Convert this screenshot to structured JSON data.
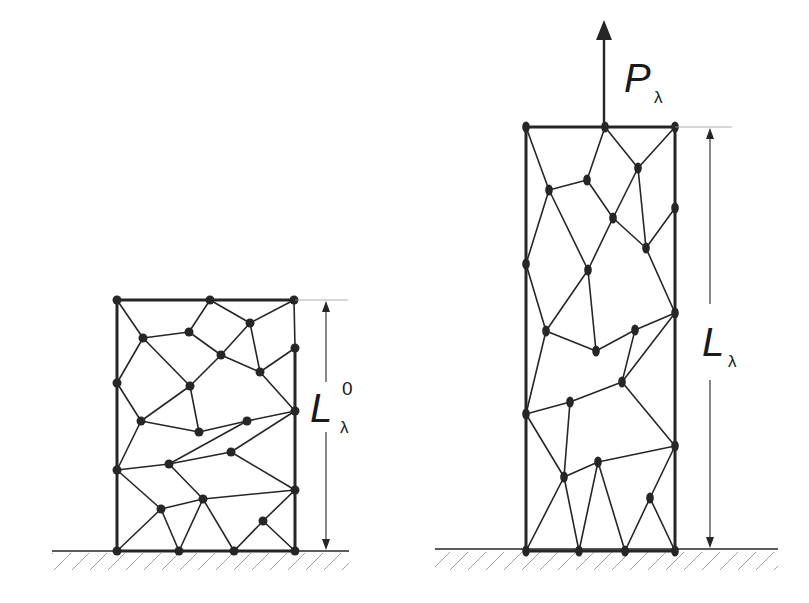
{
  "figure": {
    "colors": {
      "background": "#ffffff",
      "ink": "#262626",
      "guide": "#9a9a9a",
      "hatch": "#8c8c8c",
      "bleed_text": "#ececec"
    }
  },
  "labels": {
    "load": {
      "symbol": "P",
      "subscript": "λ"
    },
    "reference_length": {
      "symbol": "L",
      "subscript": "λ",
      "superscript": "0"
    },
    "deformed_length": {
      "symbol": "L",
      "subscript": "λ"
    }
  },
  "left_mesh": {
    "name": "reference configuration",
    "frame": {
      "x0": 117,
      "x1": 295,
      "y_top": 300,
      "y_bottom": 551
    },
    "nodes": [
      [
        117,
        300
      ],
      [
        210,
        300
      ],
      [
        294,
        300
      ],
      [
        250,
        323
      ],
      [
        189,
        332
      ],
      [
        143,
        338
      ],
      [
        221,
        355
      ],
      [
        260,
        372
      ],
      [
        295,
        348
      ],
      [
        117,
        383
      ],
      [
        190,
        386
      ],
      [
        141,
        421
      ],
      [
        199,
        432
      ],
      [
        247,
        421
      ],
      [
        295,
        411
      ],
      [
        231,
        452
      ],
      [
        169,
        464
      ],
      [
        117,
        470
      ],
      [
        295,
        490
      ],
      [
        203,
        499
      ],
      [
        161,
        509
      ],
      [
        263,
        521
      ],
      [
        117,
        551
      ],
      [
        179,
        551
      ],
      [
        234,
        551
      ],
      [
        295,
        551
      ]
    ],
    "edges": [
      [
        0,
        1
      ],
      [
        1,
        2
      ],
      [
        2,
        8
      ],
      [
        8,
        14
      ],
      [
        14,
        18
      ],
      [
        18,
        25
      ],
      [
        0,
        9
      ],
      [
        9,
        17
      ],
      [
        17,
        22
      ],
      [
        22,
        23
      ],
      [
        23,
        24
      ],
      [
        24,
        25
      ],
      [
        0,
        5
      ],
      [
        1,
        4
      ],
      [
        1,
        3
      ],
      [
        2,
        3
      ],
      [
        3,
        6
      ],
      [
        3,
        7
      ],
      [
        4,
        5
      ],
      [
        4,
        6
      ],
      [
        5,
        9
      ],
      [
        5,
        10
      ],
      [
        6,
        10
      ],
      [
        6,
        7
      ],
      [
        7,
        8
      ],
      [
        7,
        14
      ],
      [
        9,
        11
      ],
      [
        10,
        11
      ],
      [
        10,
        12
      ],
      [
        11,
        12
      ],
      [
        12,
        13
      ],
      [
        13,
        14
      ],
      [
        13,
        16
      ],
      [
        14,
        15
      ],
      [
        11,
        17
      ],
      [
        15,
        16
      ],
      [
        15,
        18
      ],
      [
        16,
        17
      ],
      [
        16,
        19
      ],
      [
        17,
        20
      ],
      [
        19,
        20
      ],
      [
        19,
        18
      ],
      [
        20,
        22
      ],
      [
        20,
        23
      ],
      [
        19,
        23
      ],
      [
        19,
        24
      ],
      [
        24,
        21
      ],
      [
        21,
        18
      ],
      [
        21,
        25
      ]
    ]
  },
  "right_mesh": {
    "name": "deformed configuration",
    "frame": {
      "x0": 526,
      "x1": 675,
      "y_top": 127,
      "y_bottom": 551
    },
    "nodes": [
      [
        526,
        127
      ],
      [
        605,
        127
      ],
      [
        675,
        127
      ],
      [
        638,
        168
      ],
      [
        587,
        180
      ],
      [
        549,
        190
      ],
      [
        613,
        218
      ],
      [
        675,
        208
      ],
      [
        646,
        248
      ],
      [
        526,
        264
      ],
      [
        588,
        270
      ],
      [
        546,
        331
      ],
      [
        635,
        330
      ],
      [
        675,
        313
      ],
      [
        596,
        351
      ],
      [
        622,
        382
      ],
      [
        570,
        402
      ],
      [
        526,
        414
      ],
      [
        675,
        446
      ],
      [
        598,
        462
      ],
      [
        564,
        477
      ],
      [
        650,
        498
      ],
      [
        526,
        551
      ],
      [
        579,
        551
      ],
      [
        625,
        551
      ],
      [
        675,
        551
      ]
    ],
    "edges": [
      [
        0,
        1
      ],
      [
        1,
        2
      ],
      [
        2,
        7
      ],
      [
        7,
        13
      ],
      [
        13,
        18
      ],
      [
        18,
        25
      ],
      [
        0,
        9
      ],
      [
        9,
        17
      ],
      [
        17,
        22
      ],
      [
        22,
        23
      ],
      [
        23,
        24
      ],
      [
        24,
        25
      ],
      [
        0,
        5
      ],
      [
        1,
        4
      ],
      [
        1,
        3
      ],
      [
        2,
        3
      ],
      [
        3,
        6
      ],
      [
        3,
        8
      ],
      [
        4,
        5
      ],
      [
        4,
        6
      ],
      [
        5,
        9
      ],
      [
        5,
        10
      ],
      [
        6,
        10
      ],
      [
        6,
        8
      ],
      [
        8,
        7
      ],
      [
        8,
        13
      ],
      [
        9,
        11
      ],
      [
        10,
        11
      ],
      [
        10,
        14
      ],
      [
        11,
        14
      ],
      [
        14,
        12
      ],
      [
        12,
        13
      ],
      [
        12,
        15
      ],
      [
        13,
        15
      ],
      [
        15,
        16
      ],
      [
        15,
        18
      ],
      [
        16,
        17
      ],
      [
        16,
        20
      ],
      [
        11,
        17
      ],
      [
        17,
        20
      ],
      [
        20,
        19
      ],
      [
        19,
        18
      ],
      [
        20,
        22
      ],
      [
        20,
        23
      ],
      [
        19,
        23
      ],
      [
        19,
        24
      ],
      [
        24,
        21
      ],
      [
        21,
        18
      ],
      [
        21,
        25
      ]
    ]
  },
  "ground": {
    "left": {
      "x0": 52,
      "x1": 349,
      "y": 551
    },
    "right": {
      "x0": 435,
      "x1": 778,
      "y": 549
    }
  },
  "dimension_arrows": {
    "reference": {
      "x": 326,
      "y_top": 300,
      "y_bottom": 551,
      "label_gap": [
        382,
        432
      ]
    },
    "deformed": {
      "x": 710,
      "y_top": 127,
      "y_bottom": 549,
      "label_gap": [
        304,
        380
      ]
    },
    "load_arrow": {
      "x": 604,
      "y_tail": 127,
      "y_head": 20
    }
  }
}
